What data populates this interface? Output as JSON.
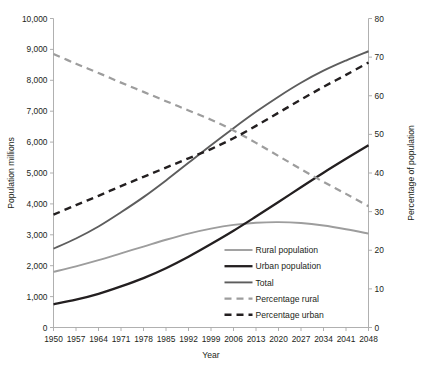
{
  "chart_data": {
    "type": "line",
    "title": "",
    "xlabel": "Year",
    "ylabel": "Population millions",
    "y2label": "Percentage of population",
    "x": [
      1950,
      1957,
      1964,
      1971,
      1978,
      1985,
      1992,
      1999,
      2006,
      2013,
      2020,
      2027,
      2034,
      2041,
      2048
    ],
    "xlim": [
      1950,
      2048
    ],
    "ylim": [
      0,
      10000
    ],
    "y2lim": [
      0,
      80
    ],
    "yticks": [
      0,
      1000,
      2000,
      3000,
      4000,
      5000,
      6000,
      7000,
      8000,
      9000,
      10000
    ],
    "ytick_labels": [
      "0",
      "1,000",
      "2,000",
      "3,000",
      "4,000",
      "5,000",
      "6,000",
      "7,000",
      "8,000",
      "9,000",
      "10,000"
    ],
    "y2ticks": [
      0,
      10,
      20,
      30,
      40,
      50,
      60,
      70,
      80
    ],
    "y2tick_labels": [
      "0",
      "10",
      "20",
      "30",
      "40",
      "50",
      "60",
      "70",
      "80"
    ],
    "xtick_labels": [
      "1950",
      "1957",
      "1964",
      "1971",
      "1978",
      "1985",
      "1992",
      "1999",
      "2006",
      "2013",
      "2020",
      "2027",
      "2034",
      "2041",
      "2048"
    ],
    "grid": false,
    "legend_position": "inside-bottom-right",
    "series": [
      {
        "name": "Rural population",
        "axis": "left",
        "color": "#9d9d9d",
        "width": 1.9,
        "dash": "none",
        "values": [
          1800,
          1980,
          2180,
          2400,
          2620,
          2840,
          3040,
          3200,
          3320,
          3390,
          3410,
          3380,
          3300,
          3180,
          3040
        ]
      },
      {
        "name": "Urban population",
        "axis": "left",
        "color": "#231f20",
        "width": 2.3,
        "dash": "none",
        "values": [
          750,
          900,
          1090,
          1330,
          1600,
          1920,
          2290,
          2700,
          3130,
          3590,
          4060,
          4540,
          5010,
          5460,
          5900
        ]
      },
      {
        "name": "Total",
        "axis": "left",
        "color": "#5d5d5d",
        "width": 1.9,
        "dash": "none",
        "values": [
          2550,
          2880,
          3270,
          3730,
          4220,
          4760,
          5330,
          5900,
          6450,
          6980,
          7470,
          7920,
          8310,
          8640,
          8940
        ]
      },
      {
        "name": "Percentage rural",
        "axis": "right",
        "color": "#9d9d9d",
        "width": 2.2,
        "dash": "7,5",
        "values": [
          70.8,
          68.3,
          65.9,
          63.4,
          61.0,
          58.6,
          56.2,
          53.8,
          51.0,
          47.8,
          44.4,
          41.0,
          37.7,
          34.6,
          31.4
        ]
      },
      {
        "name": "Percentage urban",
        "axis": "right",
        "color": "#231f20",
        "width": 2.4,
        "dash": "7,5",
        "values": [
          29.2,
          31.7,
          34.1,
          36.6,
          39.0,
          41.4,
          43.8,
          46.2,
          49.0,
          52.2,
          55.6,
          59.0,
          62.3,
          65.4,
          68.6
        ]
      }
    ]
  },
  "legend": {
    "items": [
      {
        "label": "Rural population"
      },
      {
        "label": "Urban population"
      },
      {
        "label": "Total"
      },
      {
        "label": "Percentage rural"
      },
      {
        "label": "Percentage urban"
      }
    ]
  }
}
